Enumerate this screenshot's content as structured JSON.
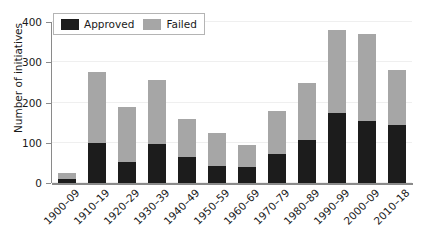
{
  "chart_data": {
    "type": "bar",
    "title": "",
    "subtitle": "",
    "xlabel": "",
    "ylabel": "Number of initiatives",
    "ylim": [
      0,
      400
    ],
    "yticks": [
      0,
      100,
      200,
      300,
      400
    ],
    "ytick_labels": [
      "0",
      "100",
      "200",
      "300",
      "400"
    ],
    "grid": true,
    "stacked": true,
    "legend_position": "upper left",
    "categories": [
      "1900–09",
      "1910–19",
      "1920–29",
      "1930–39",
      "1940–49",
      "1950–59",
      "1960–69",
      "1970–79",
      "1980–89",
      "1990–99",
      "2000–09",
      "2010–18"
    ],
    "series": [
      {
        "name": "Approved",
        "color": "#1c1c1c",
        "values": [
          10,
          100,
          52,
          96,
          65,
          42,
          40,
          72,
          108,
          175,
          155,
          143
        ]
      },
      {
        "name": "Failed",
        "color": "#a6a6a6",
        "values": [
          14,
          175,
          136,
          160,
          93,
          83,
          55,
          108,
          140,
          205,
          216,
          137
        ]
      }
    ],
    "totals": [
      24,
      275,
      188,
      256,
      158,
      125,
      95,
      180,
      248,
      380,
      371,
      280
    ]
  },
  "legend": {
    "items": [
      {
        "label": "Approved",
        "color": "#1c1c1c",
        "swatch_name": "legend-swatch-approved"
      },
      {
        "label": "Failed",
        "color": "#a6a6a6",
        "swatch_name": "legend-swatch-failed"
      }
    ]
  },
  "axes": {
    "y_title": "Number of initiatives",
    "y_tick_labels": [
      "0",
      "100",
      "200",
      "300",
      "400"
    ],
    "x_tick_labels": [
      "1900–09",
      "1910–19",
      "1920–29",
      "1930–39",
      "1940–49",
      "1950–59",
      "1960–69",
      "1970–79",
      "1980–89",
      "1990–99",
      "2000–09",
      "2010–18"
    ]
  },
  "colors": {
    "approved": "#1c1c1c",
    "failed": "#a6a6a6",
    "grid": "#efefef",
    "axis": "#8a8a8a",
    "text": "#1a1a1a",
    "background": "#ffffff"
  }
}
